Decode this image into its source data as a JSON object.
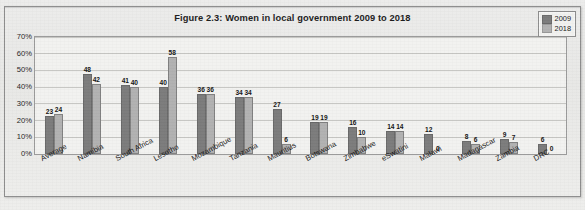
{
  "figure": {
    "title": "Figure 2.3: Women in local government 2009 to 2018"
  },
  "legend": {
    "position": "top-right",
    "entries": [
      {
        "label": "2009",
        "color": "#7c7c7c"
      },
      {
        "label": "2018",
        "color": "#b2b2b2"
      }
    ]
  },
  "axis": {
    "y_ticks": [
      "0%",
      "10%",
      "20%",
      "30%",
      "40%",
      "50%",
      "60%",
      "70%"
    ]
  },
  "footnote": "",
  "chart_data": {
    "type": "bar",
    "title": "Figure 2.3: Women in local government 2009 to 2018",
    "xlabel": "",
    "ylabel": "",
    "ylim": [
      0,
      70
    ],
    "ytick_labels": [
      "0%",
      "10%",
      "20%",
      "30%",
      "40%",
      "50%",
      "60%",
      "70%"
    ],
    "ytick_values": [
      0,
      10,
      20,
      30,
      40,
      50,
      60,
      70
    ],
    "grid": true,
    "legend_position": "top-right",
    "categories": [
      "Average",
      "Namibia",
      "South Africa",
      "Lesotho",
      "Mozambique",
      "Tanzania",
      "Mauritius",
      "Botswana",
      "Zimbabwe",
      "eSwatini",
      "Malawi",
      "Madagascar",
      "Zambia",
      "DRC"
    ],
    "series": [
      {
        "name": "2009",
        "color": "#7c7c7c",
        "values": [
          23,
          48,
          41,
          40,
          36,
          34,
          27,
          19,
          16,
          14,
          12,
          8,
          9,
          6
        ]
      },
      {
        "name": "2018",
        "color": "#b2b2b2",
        "values": [
          24,
          42,
          40,
          58,
          36,
          34,
          6,
          19,
          10,
          14,
          0,
          6,
          7,
          0
        ]
      }
    ]
  }
}
